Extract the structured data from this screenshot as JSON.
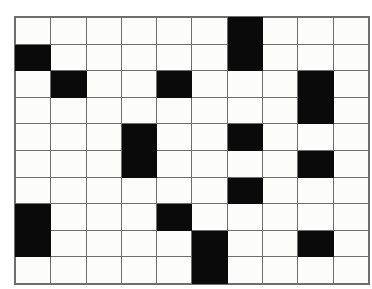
{
  "figure": {
    "name": "binary-grid-pattern",
    "type": "grid",
    "columns": 10,
    "rows": 10,
    "colors": {
      "filled": "#0a0a0a",
      "empty": "#fcfcfa",
      "gridline": "#6e6e6e",
      "background": "#ffffff"
    },
    "cells": [
      [
        0,
        0,
        0,
        0,
        0,
        0,
        1,
        0,
        0,
        0
      ],
      [
        1,
        0,
        0,
        0,
        0,
        0,
        1,
        0,
        0,
        0
      ],
      [
        0,
        1,
        0,
        0,
        1,
        0,
        0,
        0,
        1,
        0
      ],
      [
        0,
        0,
        0,
        0,
        0,
        0,
        0,
        0,
        1,
        0
      ],
      [
        0,
        0,
        0,
        1,
        0,
        0,
        1,
        0,
        0,
        0
      ],
      [
        0,
        0,
        0,
        1,
        0,
        0,
        0,
        0,
        1,
        0
      ],
      [
        0,
        0,
        0,
        0,
        0,
        0,
        1,
        0,
        0,
        0
      ],
      [
        1,
        0,
        0,
        0,
        1,
        0,
        0,
        0,
        0,
        0
      ],
      [
        1,
        0,
        0,
        0,
        0,
        1,
        0,
        0,
        1,
        0
      ],
      [
        0,
        0,
        0,
        0,
        0,
        1,
        0,
        0,
        0,
        0
      ]
    ]
  }
}
